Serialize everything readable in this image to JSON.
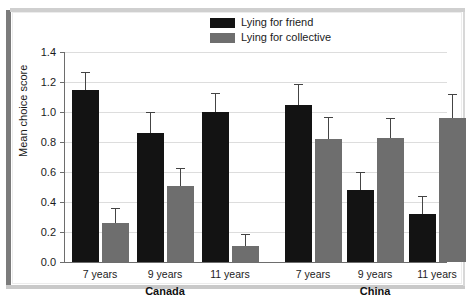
{
  "chart_data": {
    "type": "bar",
    "title": "",
    "xlabel": "",
    "ylabel": "Mean choice score",
    "ylim": [
      0.0,
      1.4
    ],
    "ytick_labels": [
      "0.0",
      "0.2",
      "0.4",
      "0.6",
      "0.8",
      "1.0",
      "1.2",
      "1.4"
    ],
    "ytick_values": [
      0.0,
      0.2,
      0.4,
      0.6,
      0.8,
      1.0,
      1.2,
      1.4
    ],
    "grid": true,
    "legend_position": "top-center",
    "categories": [
      "7 years",
      "9 years",
      "11 years",
      "7 years",
      "9 years",
      "11 years"
    ],
    "groups": [
      {
        "name": "Canada",
        "categories": [
          "7 years",
          "9 years",
          "11 years"
        ]
      },
      {
        "name": "China",
        "categories": [
          "7 years",
          "9 years",
          "11 years"
        ]
      }
    ],
    "series": [
      {
        "name": "Lying for friend",
        "color": "#131313",
        "values": [
          1.15,
          0.86,
          1.0,
          1.05,
          0.48,
          0.32
        ],
        "errors": [
          0.12,
          0.14,
          0.13,
          0.14,
          0.12,
          0.12
        ]
      },
      {
        "name": "Lying for collective",
        "color": "#6e6e6e",
        "values": [
          0.26,
          0.51,
          0.11,
          0.82,
          0.83,
          0.96
        ],
        "errors": [
          0.1,
          0.12,
          0.08,
          0.15,
          0.13,
          0.16
        ]
      }
    ]
  },
  "legend": {
    "items": [
      {
        "label": "Lying for friend",
        "color": "#131313"
      },
      {
        "label": "Lying for collective",
        "color": "#6e6e6e"
      }
    ]
  },
  "axis": {
    "y_title": "Mean choice score"
  }
}
